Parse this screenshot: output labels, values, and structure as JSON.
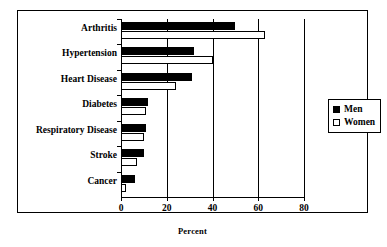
{
  "chart_data": {
    "type": "bar",
    "orientation": "horizontal",
    "title": "",
    "xlabel": "Percent",
    "ylabel": "",
    "xlim": [
      0,
      80
    ],
    "xticks": [
      0,
      20,
      40,
      60,
      80
    ],
    "xtick_labels": [
      "0",
      "20",
      "40",
      "60",
      "80"
    ],
    "grid": true,
    "legend_position": "right",
    "categories": [
      "Arthritis",
      "Hypertension",
      "Heart Disease",
      "Diabetes",
      "Respiratory Disease",
      "Stroke",
      "Cancer"
    ],
    "series": [
      {
        "name": "Men",
        "color": "#000000",
        "values": [
          50,
          32,
          31,
          12,
          11,
          10,
          6
        ]
      },
      {
        "name": "Women",
        "color": "#ffffff",
        "values": [
          63,
          40,
          24,
          11,
          10,
          7,
          2
        ]
      }
    ]
  },
  "legend": {
    "entries": [
      {
        "label": "Men",
        "swatch": "#000000"
      },
      {
        "label": "Women",
        "swatch": "#ffffff"
      }
    ]
  },
  "axis": {
    "x_title": "Percent"
  }
}
